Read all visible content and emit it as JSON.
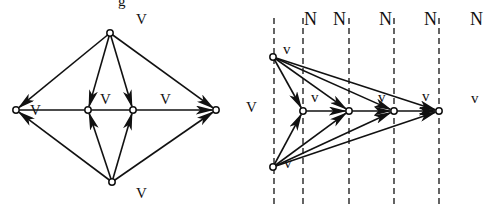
{
  "figure": {
    "background": "#ffffff",
    "ink_color": "#111111",
    "top_cutoff_glyph": "g"
  },
  "left_diagram": {
    "nodes": [
      {
        "id": "L",
        "x": 16,
        "y": 110
      },
      {
        "id": "T",
        "x": 110,
        "y": 33
      },
      {
        "id": "B",
        "x": 112,
        "y": 182
      },
      {
        "id": "M1",
        "x": 88,
        "y": 110
      },
      {
        "id": "M2",
        "x": 133,
        "y": 110
      },
      {
        "id": "R",
        "x": 216,
        "y": 110
      }
    ],
    "edges": [
      {
        "from": "T",
        "to": "L"
      },
      {
        "from": "T",
        "to": "M1"
      },
      {
        "from": "T",
        "to": "M2"
      },
      {
        "from": "T",
        "to": "R"
      },
      {
        "from": "B",
        "to": "L"
      },
      {
        "from": "B",
        "to": "M1"
      },
      {
        "from": "B",
        "to": "M2"
      },
      {
        "from": "B",
        "to": "R"
      },
      {
        "from": "L",
        "to": "R"
      }
    ],
    "labels": [
      {
        "text": "V",
        "x": 136,
        "y": 24
      },
      {
        "text": "V",
        "x": 30,
        "y": 115
      },
      {
        "text": "V",
        "x": 100,
        "y": 104
      },
      {
        "text": "V",
        "x": 160,
        "y": 104
      },
      {
        "text": "V",
        "x": 136,
        "y": 198
      }
    ]
  },
  "right_diagram": {
    "dashed_lines_x": [
      274,
      303,
      349,
      394,
      439
    ],
    "dashed_top": 18,
    "dashed_bottom": 208,
    "nodes": [
      {
        "id": "A",
        "x": 273,
        "y": 57
      },
      {
        "id": "C",
        "x": 273,
        "y": 167
      },
      {
        "id": "P1",
        "x": 303,
        "y": 111
      },
      {
        "id": "P2",
        "x": 349,
        "y": 111
      },
      {
        "id": "P3",
        "x": 394,
        "y": 111
      },
      {
        "id": "P4",
        "x": 439,
        "y": 111
      }
    ],
    "edges": [
      {
        "from": "A",
        "to": "P1"
      },
      {
        "from": "A",
        "to": "P2"
      },
      {
        "from": "A",
        "to": "P3"
      },
      {
        "from": "A",
        "to": "P4"
      },
      {
        "from": "C",
        "to": "P1"
      },
      {
        "from": "C",
        "to": "P2"
      },
      {
        "from": "C",
        "to": "P3"
      },
      {
        "from": "C",
        "to": "P4"
      },
      {
        "from": "P1",
        "to": "P2"
      },
      {
        "from": "P2",
        "to": "P3"
      },
      {
        "from": "P3",
        "to": "P4"
      }
    ],
    "n_labels": [
      {
        "text": "N",
        "x": 304,
        "y": 25
      },
      {
        "text": "N",
        "x": 333,
        "y": 25
      },
      {
        "text": "N",
        "x": 379,
        "y": 25
      },
      {
        "text": "N",
        "x": 424,
        "y": 25
      },
      {
        "text": "N",
        "x": 470,
        "y": 25
      }
    ],
    "v_labels": [
      {
        "text": "V",
        "x": 246,
        "y": 112
      },
      {
        "text": "v",
        "x": 283,
        "y": 54
      },
      {
        "text": "v",
        "x": 311,
        "y": 102
      },
      {
        "text": "v",
        "x": 378,
        "y": 102
      },
      {
        "text": "v",
        "x": 422,
        "y": 101
      },
      {
        "text": "v",
        "x": 471,
        "y": 103
      },
      {
        "text": "v",
        "x": 284,
        "y": 168
      }
    ]
  }
}
